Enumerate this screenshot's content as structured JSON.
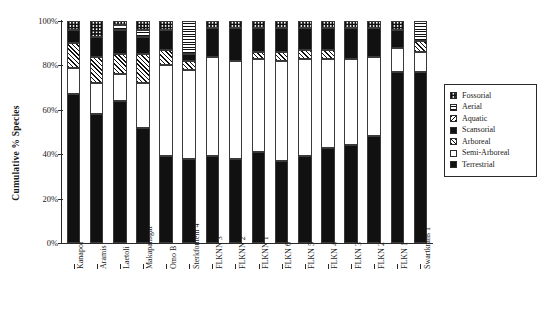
{
  "chart_data": {
    "type": "bar",
    "subtype": "stacked-bar-100pct",
    "title": "",
    "xlabel": "",
    "ylabel": "Cumulative % Species",
    "ylim": [
      0,
      100
    ],
    "ytick_labels": [
      "0%",
      "20%",
      "40%",
      "60%",
      "80%",
      "100%"
    ],
    "ytick_values": [
      0,
      20,
      40,
      60,
      80,
      100
    ],
    "grid": false,
    "legend_position": "right",
    "categories": [
      "Kanapoi",
      "Aramis",
      "Laetoli",
      "Makapansgat",
      "Omo B",
      "Sterkfontein 4",
      "FLKNN 3",
      "FLKNN 2",
      "FLKNN 1",
      "FLKN 6",
      "FLKN 5",
      "FLKN 4",
      "FLKN 3",
      "FLKN 2",
      "FLKN 1",
      "Swartkrans 1"
    ],
    "series": [
      {
        "name": "Terrestrial",
        "pattern": "solid-black",
        "values": [
          67,
          58,
          64,
          52,
          39,
          38,
          39,
          38,
          41,
          37,
          39,
          43,
          44,
          48,
          77,
          0
        ]
      },
      {
        "name": "Semi-Arboreal",
        "pattern": "white",
        "values": [
          12,
          15,
          12,
          13,
          41,
          42,
          45,
          44,
          42,
          45,
          44,
          40,
          39,
          36,
          11,
          0
        ]
      },
      {
        "name": "Arboreal",
        "pattern": "diagonal-hatch-up",
        "values": [
          14,
          9,
          8,
          13,
          4,
          4,
          0,
          0,
          3,
          4,
          4,
          4,
          0,
          0,
          0,
          0
        ]
      },
      {
        "name": "Scansorial",
        "pattern": "solid-black",
        "values": [
          5,
          14,
          12,
          8,
          12,
          2,
          13,
          15,
          11,
          11,
          10,
          10,
          14,
          13,
          8,
          0
        ]
      },
      {
        "name": "Aquatic",
        "pattern": "diagonal-hatch-down",
        "values": [
          0,
          0,
          0,
          0,
          0,
          0,
          0,
          0,
          0,
          0,
          0,
          0,
          0,
          0,
          0,
          0
        ]
      },
      {
        "name": "Aerial",
        "pattern": "horizontal-stripes",
        "values": [
          0,
          0,
          2,
          3,
          0,
          14,
          0,
          0,
          0,
          0,
          0,
          0,
          0,
          0,
          0,
          0
        ]
      },
      {
        "name": "Fossorial",
        "pattern": "checkered",
        "values": [
          2,
          4,
          2,
          11,
          4,
          0,
          3,
          3,
          3,
          3,
          3,
          3,
          3,
          3,
          4,
          0
        ]
      }
    ],
    "bars": [
      {
        "site": "Kanapoi",
        "segments": [
          {
            "s": "Terrestrial",
            "from": 0,
            "to": 67
          },
          {
            "s": "Semi-Arboreal",
            "from": 67,
            "to": 79
          },
          {
            "s": "Arboreal",
            "from": 79,
            "to": 90
          },
          {
            "s": "Scansorial",
            "from": 90,
            "to": 96
          },
          {
            "s": "Fossorial",
            "from": 96,
            "to": 100
          }
        ]
      },
      {
        "site": "Aramis",
        "segments": [
          {
            "s": "Terrestrial",
            "from": 0,
            "to": 58
          },
          {
            "s": "Semi-Arboreal",
            "from": 58,
            "to": 72
          },
          {
            "s": "Arboreal",
            "from": 72,
            "to": 84
          },
          {
            "s": "Scansorial",
            "from": 84,
            "to": 93
          },
          {
            "s": "Fossorial",
            "from": 93,
            "to": 100
          }
        ]
      },
      {
        "site": "Laetoli",
        "segments": [
          {
            "s": "Terrestrial",
            "from": 0,
            "to": 64
          },
          {
            "s": "Semi-Arboreal",
            "from": 64,
            "to": 76
          },
          {
            "s": "Arboreal",
            "from": 76,
            "to": 85
          },
          {
            "s": "Scansorial",
            "from": 85,
            "to": 96
          },
          {
            "s": "Aerial",
            "from": 96,
            "to": 98
          },
          {
            "s": "Fossorial",
            "from": 98,
            "to": 100
          }
        ]
      },
      {
        "site": "Makapansgat",
        "segments": [
          {
            "s": "Terrestrial",
            "from": 0,
            "to": 52
          },
          {
            "s": "Semi-Arboreal",
            "from": 52,
            "to": 72
          },
          {
            "s": "Arboreal",
            "from": 72,
            "to": 85
          },
          {
            "s": "Scansorial",
            "from": 85,
            "to": 93
          },
          {
            "s": "Aerial",
            "from": 93,
            "to": 96
          },
          {
            "s": "Fossorial",
            "from": 96,
            "to": 100
          }
        ]
      },
      {
        "site": "Omo B",
        "segments": [
          {
            "s": "Terrestrial",
            "from": 0,
            "to": 39
          },
          {
            "s": "Semi-Arboreal",
            "from": 39,
            "to": 80
          },
          {
            "s": "Arboreal",
            "from": 80,
            "to": 87
          },
          {
            "s": "Scansorial",
            "from": 87,
            "to": 96
          },
          {
            "s": "Fossorial",
            "from": 96,
            "to": 100
          }
        ]
      },
      {
        "site": "Sterkfontein 4",
        "segments": [
          {
            "s": "Terrestrial",
            "from": 0,
            "to": 38
          },
          {
            "s": "Semi-Arboreal",
            "from": 38,
            "to": 78
          },
          {
            "s": "Arboreal",
            "from": 78,
            "to": 82
          },
          {
            "s": "Scansorial",
            "from": 82,
            "to": 85
          },
          {
            "s": "Aerial",
            "from": 85,
            "to": 100
          }
        ]
      },
      {
        "site": "FLKNN 3",
        "segments": [
          {
            "s": "Terrestrial",
            "from": 0,
            "to": 39
          },
          {
            "s": "Semi-Arboreal",
            "from": 39,
            "to": 84
          },
          {
            "s": "Scansorial",
            "from": 84,
            "to": 97
          },
          {
            "s": "Fossorial",
            "from": 97,
            "to": 100
          }
        ]
      },
      {
        "site": "FLKNN 2",
        "segments": [
          {
            "s": "Terrestrial",
            "from": 0,
            "to": 38
          },
          {
            "s": "Semi-Arboreal",
            "from": 38,
            "to": 82
          },
          {
            "s": "Scansorial",
            "from": 82,
            "to": 97
          },
          {
            "s": "Fossorial",
            "from": 97,
            "to": 100
          }
        ]
      },
      {
        "site": "FLKNN 1",
        "segments": [
          {
            "s": "Terrestrial",
            "from": 0,
            "to": 41
          },
          {
            "s": "Semi-Arboreal",
            "from": 41,
            "to": 83
          },
          {
            "s": "Arboreal",
            "from": 83,
            "to": 86
          },
          {
            "s": "Scansorial",
            "from": 86,
            "to": 97
          },
          {
            "s": "Fossorial",
            "from": 97,
            "to": 100
          }
        ]
      },
      {
        "site": "FLKN 6",
        "segments": [
          {
            "s": "Terrestrial",
            "from": 0,
            "to": 37
          },
          {
            "s": "Semi-Arboreal",
            "from": 37,
            "to": 82
          },
          {
            "s": "Arboreal",
            "from": 82,
            "to": 86
          },
          {
            "s": "Scansorial",
            "from": 86,
            "to": 97
          },
          {
            "s": "Fossorial",
            "from": 97,
            "to": 100
          }
        ]
      },
      {
        "site": "FLKN 5",
        "segments": [
          {
            "s": "Terrestrial",
            "from": 0,
            "to": 39
          },
          {
            "s": "Semi-Arboreal",
            "from": 39,
            "to": 83
          },
          {
            "s": "Arboreal",
            "from": 83,
            "to": 87
          },
          {
            "s": "Scansorial",
            "from": 87,
            "to": 97
          },
          {
            "s": "Fossorial",
            "from": 97,
            "to": 100
          }
        ]
      },
      {
        "site": "FLKN 4",
        "segments": [
          {
            "s": "Terrestrial",
            "from": 0,
            "to": 43
          },
          {
            "s": "Semi-Arboreal",
            "from": 43,
            "to": 83
          },
          {
            "s": "Arboreal",
            "from": 83,
            "to": 87
          },
          {
            "s": "Scansorial",
            "from": 87,
            "to": 97
          },
          {
            "s": "Fossorial",
            "from": 97,
            "to": 100
          }
        ]
      },
      {
        "site": "FLKN 3",
        "segments": [
          {
            "s": "Terrestrial",
            "from": 0,
            "to": 44
          },
          {
            "s": "Semi-Arboreal",
            "from": 44,
            "to": 83
          },
          {
            "s": "Scansorial",
            "from": 83,
            "to": 97
          },
          {
            "s": "Fossorial",
            "from": 97,
            "to": 100
          }
        ]
      },
      {
        "site": "FLKN 2",
        "segments": [
          {
            "s": "Terrestrial",
            "from": 0,
            "to": 48
          },
          {
            "s": "Semi-Arboreal",
            "from": 48,
            "to": 84
          },
          {
            "s": "Scansorial",
            "from": 84,
            "to": 97
          },
          {
            "s": "Fossorial",
            "from": 97,
            "to": 100
          }
        ]
      },
      {
        "site": "FLKN 1",
        "segments": [
          {
            "s": "Terrestrial",
            "from": 0,
            "to": 77
          },
          {
            "s": "Semi-Arboreal",
            "from": 77,
            "to": 88
          },
          {
            "s": "Scansorial",
            "from": 88,
            "to": 96
          },
          {
            "s": "Fossorial",
            "from": 96,
            "to": 100
          }
        ]
      },
      {
        "site": "Swartkrans 1",
        "segments": [
          {
            "s": "Terrestrial",
            "from": 0,
            "to": 77
          },
          {
            "s": "Semi-Arboreal",
            "from": 77,
            "to": 86
          },
          {
            "s": "Arboreal",
            "from": 86,
            "to": 91
          },
          {
            "s": "Aerial",
            "from": 91,
            "to": 100
          }
        ]
      }
    ],
    "legend": [
      {
        "label": "Fossorial",
        "pattern": "checkered"
      },
      {
        "label": "Aerial",
        "pattern": "horizontal-stripes"
      },
      {
        "label": "Aquatic",
        "pattern": "diagonal-hatch-down"
      },
      {
        "label": "Scansorial",
        "pattern": "solid-black"
      },
      {
        "label": "Arboreal",
        "pattern": "diagonal-hatch-up"
      },
      {
        "label": "Semi-Arboreal",
        "pattern": "white"
      },
      {
        "label": "Terrestrial",
        "pattern": "solid-black"
      }
    ]
  }
}
